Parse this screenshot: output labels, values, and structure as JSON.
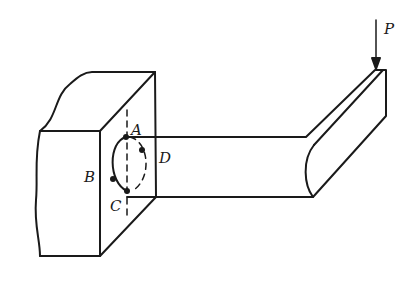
{
  "figure": {
    "labels": {
      "load": "P",
      "point_a": "A",
      "point_b": "B",
      "point_c": "C",
      "point_d": "D"
    },
    "colors": {
      "stroke": "#1a1a1a",
      "background": "#ffffff"
    }
  }
}
